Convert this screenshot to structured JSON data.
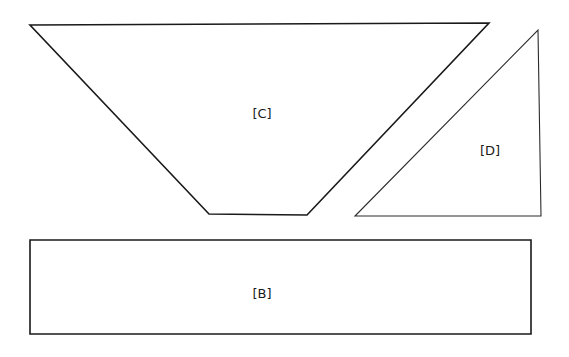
{
  "diagram": {
    "shapes": [
      {
        "id": "C",
        "type": "trapezoid",
        "label": "[C]",
        "points": [
          [
            30,
            25
          ],
          [
            489,
            23
          ],
          [
            307,
            215
          ],
          [
            209,
            214
          ]
        ],
        "label_pos": [
          262,
          113
        ]
      },
      {
        "id": "D",
        "type": "right-triangle",
        "label": "[D]",
        "points": [
          [
            538,
            30
          ],
          [
            541,
            216
          ],
          [
            355,
            216
          ]
        ],
        "label_pos": [
          490,
          150
        ]
      },
      {
        "id": "B",
        "type": "rectangle",
        "label": "[B]",
        "points": [
          [
            30,
            240
          ],
          [
            531,
            240
          ],
          [
            531,
            334
          ],
          [
            30,
            334
          ]
        ],
        "label_pos": [
          262,
          293
        ]
      }
    ],
    "stroke_color": "#1a1a1a",
    "background": "#ffffff"
  }
}
